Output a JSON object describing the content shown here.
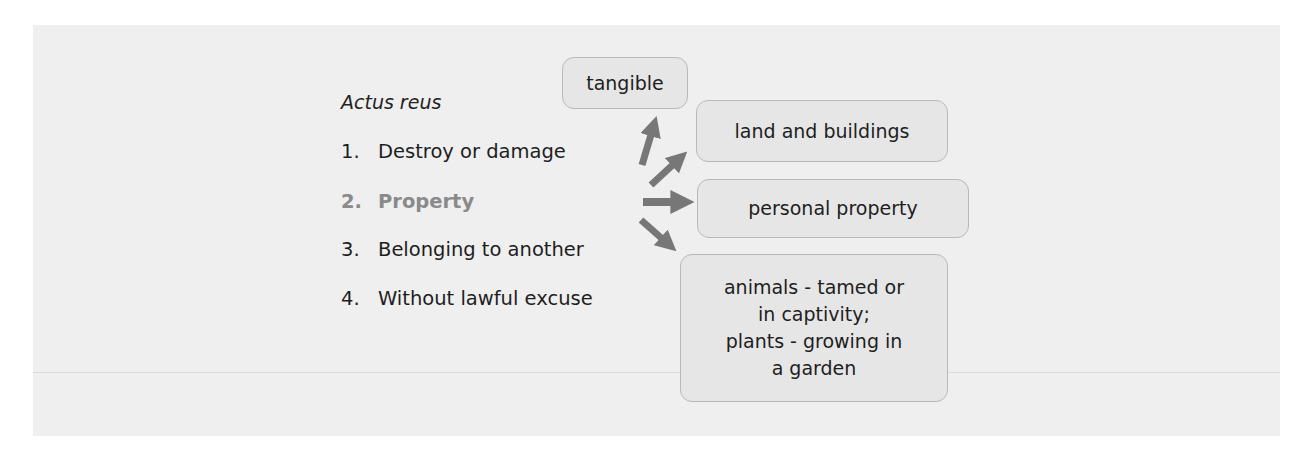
{
  "diagram": {
    "heading": "Actus reus",
    "elements": [
      {
        "number": "1.",
        "label": "Destroy or damage",
        "highlighted": false
      },
      {
        "number": "2.",
        "label": "Property",
        "highlighted": true
      },
      {
        "number": "3.",
        "label": "Belonging to another",
        "highlighted": false
      },
      {
        "number": "4.",
        "label": "Without lawful excuse",
        "highlighted": false
      }
    ],
    "property_types": {
      "tangible": "tangible",
      "land": "land and buildings",
      "personal": "personal property",
      "animals_plants": {
        "line1": "animals - tamed or",
        "line2": "in captivity;",
        "line3": "plants - growing in",
        "line4": "a garden"
      }
    },
    "colors": {
      "panel": "#efefef",
      "box_fill": "#e6e6e6",
      "box_border": "#b9b9b9",
      "arrow": "#777777",
      "highlight_text": "#8a8a8a"
    }
  }
}
